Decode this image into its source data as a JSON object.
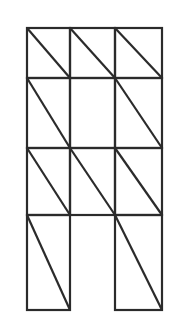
{
  "figure": {
    "background_color": "#ffffff",
    "line_color": "#2b2b2b",
    "line_width": 2.2,
    "canvas": {
      "width": 184,
      "height": 333
    },
    "grid": {
      "columns": 3,
      "rows": 4,
      "x_positions": [
        27,
        70,
        115,
        162
      ],
      "y_positions": [
        28,
        78,
        148,
        215,
        310
      ],
      "column_widths": [
        43,
        45,
        47
      ],
      "row_heights": [
        50,
        70,
        67,
        95
      ]
    },
    "diagonal_direction": "top-left-to-bottom-right",
    "cells": [
      {
        "row": 1,
        "col": 1,
        "x": 27,
        "y": 28,
        "width": 43,
        "height": 50,
        "present": true,
        "diagonal": true
      },
      {
        "row": 1,
        "col": 2,
        "x": 70,
        "y": 28,
        "width": 45,
        "height": 50,
        "present": true,
        "diagonal": true
      },
      {
        "row": 1,
        "col": 3,
        "x": 115,
        "y": 28,
        "width": 47,
        "height": 50,
        "present": true,
        "diagonal": true
      },
      {
        "row": 2,
        "col": 1,
        "x": 27,
        "y": 78,
        "width": 43,
        "height": 70,
        "present": true,
        "diagonal": true
      },
      {
        "row": 2,
        "col": 2,
        "x": 70,
        "y": 78,
        "width": 45,
        "height": 70,
        "present": true,
        "diagonal": false
      },
      {
        "row": 2,
        "col": 3,
        "x": 115,
        "y": 78,
        "width": 47,
        "height": 70,
        "present": true,
        "diagonal": true
      },
      {
        "row": 3,
        "col": 1,
        "x": 27,
        "y": 148,
        "width": 43,
        "height": 67,
        "present": true,
        "diagonal": true
      },
      {
        "row": 3,
        "col": 2,
        "x": 70,
        "y": 148,
        "width": 45,
        "height": 67,
        "present": true,
        "diagonal": true
      },
      {
        "row": 3,
        "col": 3,
        "x": 115,
        "y": 148,
        "width": 47,
        "height": 67,
        "present": true,
        "diagonal": true
      },
      {
        "row": 4,
        "col": 1,
        "x": 27,
        "y": 215,
        "width": 43,
        "height": 95,
        "present": true,
        "diagonal": true
      },
      {
        "row": 4,
        "col": 2,
        "x": 70,
        "y": 215,
        "width": 45,
        "height": 95,
        "present": false,
        "diagonal": false
      },
      {
        "row": 4,
        "col": 3,
        "x": 115,
        "y": 215,
        "width": 47,
        "height": 95,
        "present": true,
        "diagonal": true
      }
    ],
    "counts": {
      "total_cells_drawn": 11,
      "cells_with_diagonal": 10,
      "cells_without_diagonal": 1,
      "missing_cells": 1
    }
  }
}
